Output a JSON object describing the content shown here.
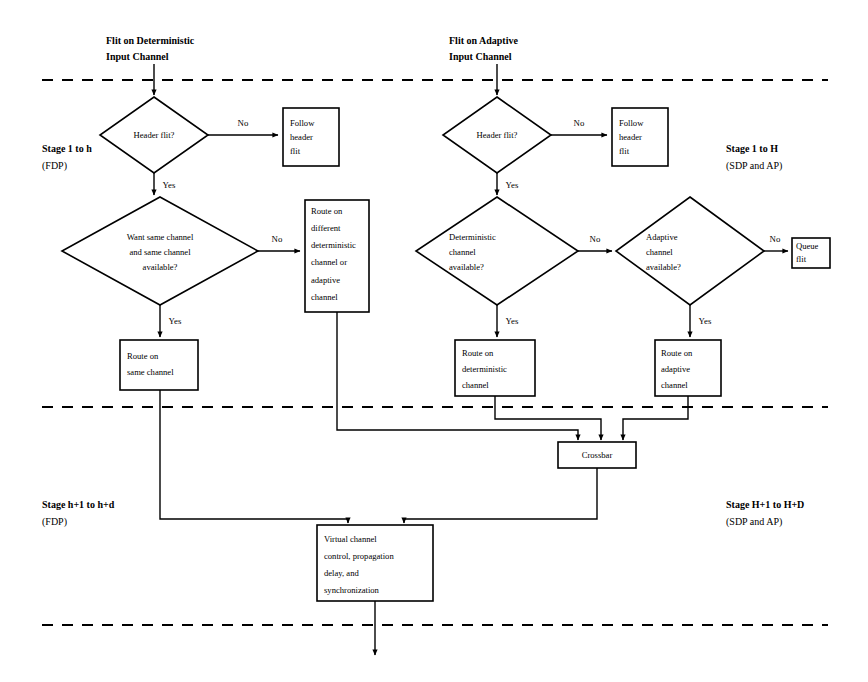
{
  "diagram": {
    "background_color": "#ffffff",
    "line_color": "#000000"
  },
  "entry_points": {
    "deterministic": {
      "line1": "Flit on Deterministic",
      "line2": "Input Channel"
    },
    "adaptive": {
      "line1": "Flit on Adaptive",
      "line2": "Input Channel"
    }
  },
  "stage_labels": {
    "left_top": {
      "line1": "Stage 1 to h",
      "line2": "(FDP)"
    },
    "right_top": {
      "line1": "Stage 1 to H",
      "line2": "(SDP and AP)"
    },
    "left_bottom": {
      "line1": "Stage h+1 to h+d",
      "line2": "(FDP)"
    },
    "right_bottom": {
      "line1": "Stage H+1 to H+D",
      "line2": "(SDP and AP)"
    }
  },
  "decisions": {
    "header_flit_left": {
      "line1": "Header flit?"
    },
    "header_flit_right": {
      "line1": "Header flit?"
    },
    "want_same_channel": {
      "line1": "Want same channel",
      "line2": "and same channel",
      "line3": "available?"
    },
    "deterministic_available": {
      "line1": "Deterministic",
      "line2": "channel",
      "line3": "available?"
    },
    "adaptive_available": {
      "line1": "Adaptive",
      "line2": "channel",
      "line3": "available?"
    }
  },
  "processes": {
    "follow_header_left": {
      "line1": "Follow",
      "line2": "header",
      "line3": "flit"
    },
    "follow_header_right": {
      "line1": "Follow",
      "line2": "header",
      "line3": "flit"
    },
    "route_different": {
      "line1": "Route on",
      "line2": "different",
      "line3": "deterministic",
      "line4": "channel or",
      "line5": "adaptive",
      "line6": "channel"
    },
    "route_same_channel": {
      "line1": "Route on",
      "line2": "same channel"
    },
    "route_deterministic": {
      "line1": "Route on",
      "line2": "deterministic",
      "line3": "channel"
    },
    "route_adaptive": {
      "line1": "Route on",
      "line2": "adaptive",
      "line3": "channel"
    },
    "queue_flit": {
      "line1": "Queue",
      "line2": "flit"
    },
    "crossbar": {
      "line1": "Crossbar"
    },
    "virtual_channel": {
      "line1": "Virtual channel",
      "line2": "control, propagation",
      "line3": "delay, and",
      "line4": "synchronization"
    }
  },
  "edge_labels": {
    "hf_left_no": "No",
    "hf_left_yes": "Yes",
    "hf_right_no": "No",
    "hf_right_yes": "Yes",
    "want_no": "No",
    "want_yes": "Yes",
    "det_no": "No",
    "det_yes": "Yes",
    "adapt_no": "No",
    "adapt_yes": "Yes"
  }
}
